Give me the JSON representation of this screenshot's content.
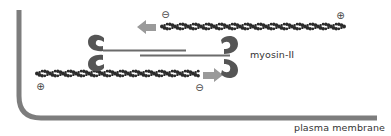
{
  "diagram": {
    "labels": {
      "myosin": "myosin-II",
      "membrane": "plasma membrane"
    },
    "polarity": {
      "top_filament_minus": "⊖",
      "top_filament_plus": "⊕",
      "bottom_filament_plus": "⊕",
      "bottom_filament_minus": "⊖"
    },
    "colors": {
      "membrane": "#7d7d7d",
      "actin": "#2b2b2b",
      "myosin_head": "#555555",
      "myosin_tail": "#6b6b6b",
      "arrow": "#9a9a9a",
      "text": "#333333"
    },
    "arrows": {
      "top": "left",
      "bottom": "right"
    }
  }
}
